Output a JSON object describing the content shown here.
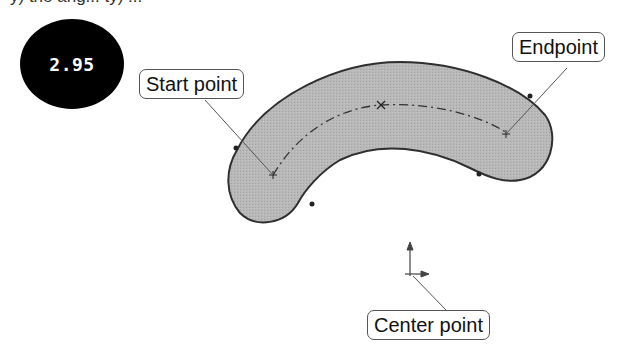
{
  "header": {
    "cut_text": "y) the ang... ty) ..."
  },
  "badge": {
    "label": "2.95",
    "color": "#000000"
  },
  "diagram": {
    "shape": "slot-arc",
    "fill_color": "#b5b5b5",
    "outline_color": "#333333",
    "callouts": {
      "start": "Start point",
      "end": "Endpoint",
      "center": "Center point"
    }
  }
}
